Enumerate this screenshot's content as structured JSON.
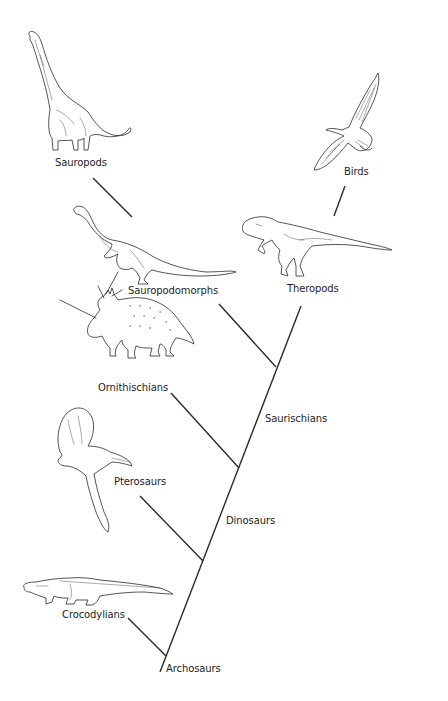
{
  "diagram": {
    "type": "cladogram",
    "title": "",
    "line_color": "#2b2b2b",
    "background": "#ffffff",
    "taxa": [
      {
        "id": "sauropods",
        "label": "Sauropods",
        "illustration": "brachiosaur-sauropod"
      },
      {
        "id": "birds",
        "label": "Birds",
        "illustration": "soaring-eagle"
      },
      {
        "id": "theropods",
        "label": "Theropods",
        "illustration": "tyrannosaur-theropod"
      },
      {
        "id": "sauropodomorphs",
        "label": "Sauropodomorphs",
        "illustration": "prosauropod"
      },
      {
        "id": "ornithischians",
        "label": "Ornithischians",
        "illustration": "styracosaurus-ceratopsian"
      },
      {
        "id": "pterosaurs",
        "label": "Pterosaurs",
        "illustration": "crested-pterosaur"
      },
      {
        "id": "crocodylians",
        "label": "Crocodylians",
        "illustration": "crocodile"
      }
    ],
    "clades": [
      {
        "id": "saurischians",
        "label": "Saurischians"
      },
      {
        "id": "dinosaurs",
        "label": "Dinosaurs"
      },
      {
        "id": "archosaurs",
        "label": "Archosaurs"
      }
    ]
  }
}
